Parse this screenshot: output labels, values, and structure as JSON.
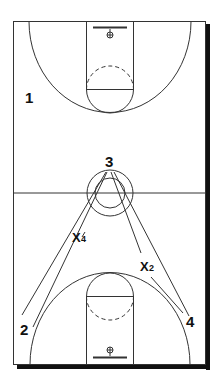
{
  "diagram": {
    "type": "basketball-full-court-play",
    "colors": {
      "line": "#333333",
      "shadow": "#111111",
      "background": "#ffffff",
      "text": "#111111"
    },
    "players": [
      {
        "id": "p1",
        "label": "1",
        "x": 25,
        "y": 103
      },
      {
        "id": "p3",
        "label": "3",
        "x": 111,
        "y": 168
      },
      {
        "id": "p2",
        "label": "2",
        "x": 26,
        "y": 335
      },
      {
        "id": "p4",
        "label": "4",
        "x": 192,
        "y": 327
      }
    ],
    "defenders": [
      {
        "id": "x4",
        "label": "X",
        "sub": "4",
        "x": 73,
        "y": 240
      },
      {
        "id": "x2",
        "label": "X",
        "sub": "2",
        "x": 140,
        "y": 271
      }
    ]
  }
}
